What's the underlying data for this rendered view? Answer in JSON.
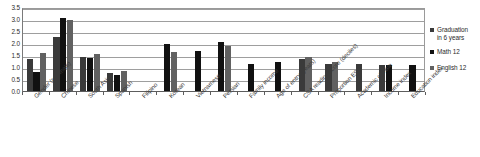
{
  "chart_data": {
    "type": "bar",
    "title": "",
    "xlabel": "",
    "ylabel": "",
    "ylim": [
      0.0,
      3.5
    ],
    "ytick_labels": [
      "0.0",
      "0.5",
      "1.0",
      "1.5",
      "2.0",
      "2.5",
      "3.0",
      "3.5"
    ],
    "ytick_values": [
      0.0,
      0.5,
      1.0,
      1.5,
      2.0,
      2.5,
      3.0,
      3.5
    ],
    "grid": true,
    "legend_position": "right",
    "categories": [
      "Gender (ref=male)",
      "Chinese",
      "South Asian",
      "Spanish",
      "Filipino",
      "Korean",
      "Vietnamese",
      "Persian",
      "Family income",
      "Age of entry (years)",
      "CSA reading score (deciles)",
      "Proportion ESL",
      "Academic climate",
      "Income index",
      "Education index"
    ],
    "series": [
      {
        "name": "Graduation in 6 years",
        "color": "#3a3a3a",
        "values": [
          1.33,
          2.25,
          1.43,
          0.74,
          null,
          null,
          null,
          null,
          null,
          null,
          1.35,
          1.13,
          1.12,
          1.08,
          null
        ]
      },
      {
        "name": "Math 12",
        "color": "#111111",
        "values": [
          0.81,
          3.06,
          1.38,
          0.68,
          null,
          1.97,
          1.65,
          2.03,
          1.13,
          1.19,
          null,
          null,
          null,
          1.07,
          1.09
        ]
      },
      {
        "name": "English 12",
        "color": "#616161",
        "values": [
          1.59,
          2.94,
          1.55,
          0.83,
          null,
          1.63,
          null,
          1.88,
          null,
          null,
          1.42,
          1.21,
          null,
          null,
          null
        ]
      }
    ]
  },
  "legend": {
    "items": [
      {
        "label": "Graduation\nin 6 years",
        "series": 0
      },
      {
        "label": "Math 12",
        "series": 1
      },
      {
        "label": "English 12",
        "series": 2
      }
    ]
  }
}
